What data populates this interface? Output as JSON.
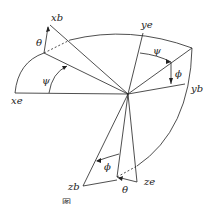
{
  "diagram": {
    "type": "euler-angle-rotation",
    "labels": {
      "xb": "xb",
      "ye": "ye",
      "yb": "yb",
      "xe": "xe",
      "zb": "zb",
      "ze": "ze"
    },
    "angles": {
      "theta_top": "θ",
      "psi_left": "ψ",
      "psi_right": "ψ",
      "phi_right": "ϕ",
      "phi_bottom": "ϕ",
      "theta_bottom": "θ"
    },
    "caption": "图 …"
  }
}
